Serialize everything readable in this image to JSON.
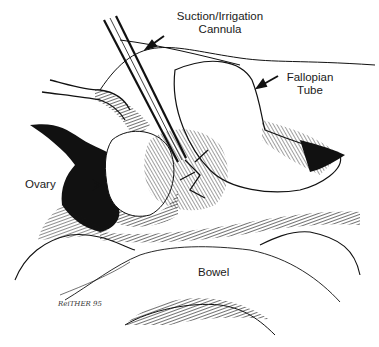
{
  "figure": {
    "type": "medical line illustration",
    "labels": {
      "cannula": [
        "Suction/Irrigation",
        "Cannula"
      ],
      "fallopian_tube": [
        "Fallopian",
        "Tube"
      ],
      "ovary": "Ovary",
      "bowel": "Bowel"
    },
    "signature": "ReiTHER 95",
    "colors": {
      "ink": "#111111",
      "background": "#ffffff"
    }
  }
}
